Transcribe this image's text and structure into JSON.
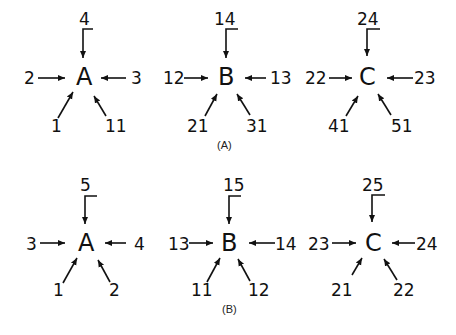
{
  "panels": [
    {
      "caption": "(A)",
      "nodes": [
        {
          "name": "A",
          "top": "4",
          "left": "2",
          "right": "3",
          "bottom_left": "1",
          "bottom_right": "11"
        },
        {
          "name": "B",
          "top": "14",
          "left": "12",
          "right": "13",
          "bottom_left": "21",
          "bottom_right": "31"
        },
        {
          "name": "C",
          "top": "24",
          "left": "22",
          "right": "23",
          "bottom_left": "41",
          "bottom_right": "51"
        }
      ]
    },
    {
      "caption": "(B)",
      "nodes": [
        {
          "name": "A",
          "top": "5",
          "left": "3",
          "right": "4",
          "bottom_left": "1",
          "bottom_right": "2"
        },
        {
          "name": "B",
          "top": "15",
          "left": "13",
          "right": "14",
          "bottom_left": "11",
          "bottom_right": "12"
        },
        {
          "name": "C",
          "top": "25",
          "left": "23",
          "right": "24",
          "bottom_left": "21",
          "bottom_right": "22"
        }
      ]
    }
  ]
}
